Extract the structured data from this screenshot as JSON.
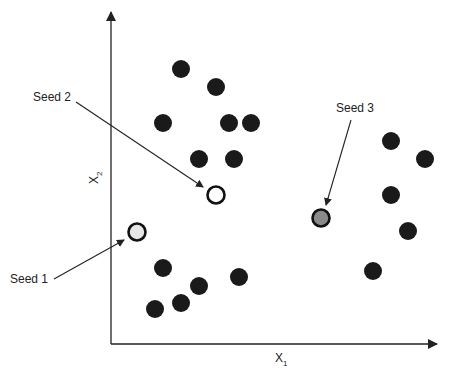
{
  "diagram": {
    "axes": {
      "x_label": "X",
      "x_sub": "1",
      "y_label": "X",
      "y_sub": "2",
      "origin": [
        111,
        344
      ],
      "x_end": 437,
      "y_end": 12
    },
    "colors": {
      "point": "#1a1a1a",
      "axis": "#222222",
      "seed1_fill": "#e6e6e6",
      "seed2_fill": "#ffffff",
      "seed3_fill": "#8a8a8a"
    },
    "points": [
      [
        181,
        69
      ],
      [
        216,
        87
      ],
      [
        163,
        123
      ],
      [
        229,
        123
      ],
      [
        251,
        123
      ],
      [
        199,
        159
      ],
      [
        234,
        159
      ],
      [
        163,
        268
      ],
      [
        199,
        286
      ],
      [
        239,
        277
      ],
      [
        181,
        303
      ],
      [
        155,
        309
      ],
      [
        391,
        141
      ],
      [
        425,
        159
      ],
      [
        391,
        195
      ],
      [
        408,
        231
      ],
      [
        373,
        271
      ]
    ],
    "seeds": [
      {
        "label": "Seed 1",
        "pos": [
          137,
          232
        ],
        "label_pos": [
          10,
          283
        ],
        "arrow_from": [
          54,
          279
        ],
        "arrow_to": [
          124,
          240
        ]
      },
      {
        "label": "Seed 2",
        "pos": [
          216,
          195
        ],
        "label_pos": [
          33,
          101
        ],
        "arrow_from": [
          76,
          102
        ],
        "arrow_to": [
          203,
          187
        ]
      },
      {
        "label": "Seed 3",
        "pos": [
          321,
          218
        ],
        "label_pos": [
          336,
          112
        ],
        "arrow_from": [
          351,
          120
        ],
        "arrow_to": [
          326,
          205
        ]
      }
    ]
  }
}
